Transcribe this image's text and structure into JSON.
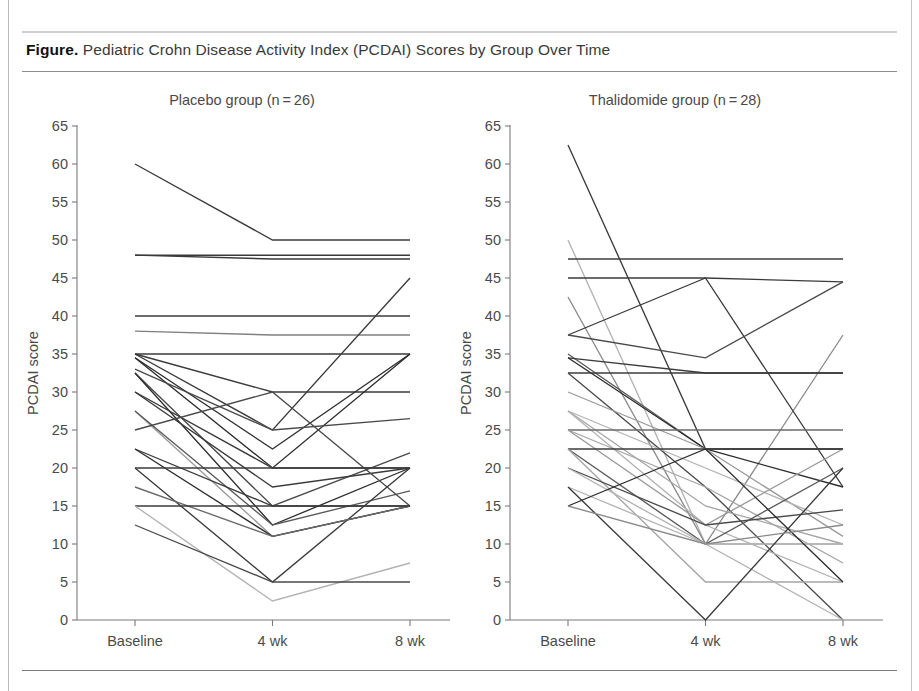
{
  "figure": {
    "label": "Figure.",
    "caption": "Pediatric Crohn Disease Activity Index (PCDAI) Scores by Group Over Time"
  },
  "chart_data": {
    "type": "line",
    "subtype": "parallel-coordinates-spaghetti",
    "title": "Pediatric Crohn Disease Activity Index (PCDAI) Scores by Group Over Time",
    "xlabel": "",
    "ylabel": "PCDAI score",
    "x": [
      "Baseline",
      "4 wk",
      "8 wk"
    ],
    "ylim": [
      0,
      65
    ],
    "yticks": [
      0,
      5,
      10,
      15,
      20,
      25,
      30,
      35,
      40,
      45,
      50,
      55,
      60,
      65
    ],
    "ytick_labels": [
      "0",
      "5",
      "10",
      "15",
      "20",
      "25",
      "30",
      "35",
      "40",
      "45",
      "50",
      "55",
      "60",
      "65"
    ],
    "grid": false,
    "legend": "none",
    "panels": [
      {
        "name": "placebo",
        "title": "Placebo group (n = 26)",
        "n": 26,
        "series": [
          {
            "name": "P1",
            "values": [
              60,
              50,
              50
            ],
            "shade": "#3b3b3b"
          },
          {
            "name": "P2",
            "values": [
              48,
              48,
              48
            ],
            "shade": "#3b3b3b"
          },
          {
            "name": "P3",
            "values": [
              48,
              47.5,
              47.5
            ],
            "shade": "#3b3b3b"
          },
          {
            "name": "P4",
            "values": [
              40,
              40,
              40
            ],
            "shade": "#3b3b3b"
          },
          {
            "name": "P5",
            "values": [
              38,
              37.5,
              37.5
            ],
            "shade": "#808080"
          },
          {
            "name": "P6",
            "values": [
              35,
              35,
              35
            ],
            "shade": "#3b3b3b"
          },
          {
            "name": "P7",
            "values": [
              35,
              30,
              30
            ],
            "shade": "#3b3b3b"
          },
          {
            "name": "P8",
            "values": [
              35,
              25,
              45
            ],
            "shade": "#3b3b3b"
          },
          {
            "name": "P9",
            "values": [
              34.5,
              22.5,
              35
            ],
            "shade": "#2d2d2d"
          },
          {
            "name": "P10",
            "values": [
              34.5,
              20,
              35
            ],
            "shade": "#2d2d2d"
          },
          {
            "name": "P11",
            "values": [
              33,
              25,
              26.5
            ],
            "shade": "#4a4a4a"
          },
          {
            "name": "P12",
            "values": [
              32.5,
              15,
              22
            ],
            "shade": "#4a4a4a"
          },
          {
            "name": "P13",
            "values": [
              32.5,
              12.5,
              20
            ],
            "shade": "#2d2d2d"
          },
          {
            "name": "P14",
            "values": [
              30,
              17.5,
              20
            ],
            "shade": "#3b3b3b"
          },
          {
            "name": "P15",
            "values": [
              30,
              20,
              20
            ],
            "shade": "#3b3b3b"
          },
          {
            "name": "P16",
            "values": [
              27.5,
              11,
              15
            ],
            "shade": "#9a9a9a"
          },
          {
            "name": "P17",
            "values": [
              27.5,
              12.5,
              17
            ],
            "shade": "#5a5a5a"
          },
          {
            "name": "P18",
            "values": [
              25,
              30,
              15
            ],
            "shade": "#4a4a4a"
          },
          {
            "name": "P19",
            "values": [
              22.5,
              11,
              15
            ],
            "shade": "#2d2d2d"
          },
          {
            "name": "P20",
            "values": [
              22.5,
              15,
              15
            ],
            "shade": "#3b3b3b"
          },
          {
            "name": "P21",
            "values": [
              20,
              20,
              20
            ],
            "shade": "#3b3b3b"
          },
          {
            "name": "P22",
            "values": [
              20,
              5,
              20
            ],
            "shade": "#3b3b3b"
          },
          {
            "name": "P23",
            "values": [
              17.5,
              11,
              15
            ],
            "shade": "#6a6a6a"
          },
          {
            "name": "P24",
            "values": [
              15,
              15,
              15
            ],
            "shade": "#3b3b3b"
          },
          {
            "name": "P25",
            "values": [
              15,
              2.5,
              7.5
            ],
            "shade": "#b3b3b3"
          },
          {
            "name": "P26",
            "values": [
              12.5,
              5,
              5
            ],
            "shade": "#4a4a4a"
          }
        ]
      },
      {
        "name": "thalidomide",
        "title": "Thalidomide group (n = 28)",
        "n": 28,
        "series": [
          {
            "name": "T1",
            "values": [
              62.5,
              22.5,
              22.5
            ],
            "shade": "#3b3b3b"
          },
          {
            "name": "T2",
            "values": [
              50,
              10,
              10
            ],
            "shade": "#b3b3b3"
          },
          {
            "name": "T3",
            "values": [
              47.5,
              47.5,
              47.5
            ],
            "shade": "#3b3b3b"
          },
          {
            "name": "T4",
            "values": [
              45,
              45,
              44.5
            ],
            "shade": "#3b3b3b"
          },
          {
            "name": "T5",
            "values": [
              42.5,
              10,
              37.5
            ],
            "shade": "#8a8a8a"
          },
          {
            "name": "T6",
            "values": [
              37.5,
              45,
              17.5
            ],
            "shade": "#3b3b3b"
          },
          {
            "name": "T7",
            "values": [
              37.5,
              34.5,
              44.5
            ],
            "shade": "#4a4a4a"
          },
          {
            "name": "T8",
            "values": [
              35,
              22.5,
              22.5
            ],
            "shade": "#5a5a5a"
          },
          {
            "name": "T9",
            "values": [
              34.5,
              32.5,
              32.5
            ],
            "shade": "#3b3b3b"
          },
          {
            "name": "T10",
            "values": [
              34.5,
              22.5,
              17.5
            ],
            "shade": "#2d2d2d"
          },
          {
            "name": "T11",
            "values": [
              32.5,
              32.5,
              32.5
            ],
            "shade": "#3b3b3b"
          },
          {
            "name": "T12",
            "values": [
              32.5,
              17.5,
              0
            ],
            "shade": "#4a4a4a"
          },
          {
            "name": "T13",
            "values": [
              30,
              22.5,
              11
            ],
            "shade": "#9a9a9a"
          },
          {
            "name": "T14",
            "values": [
              27.5,
              20,
              12.5
            ],
            "shade": "#b3b3b3"
          },
          {
            "name": "T15",
            "values": [
              27.5,
              15,
              10
            ],
            "shade": "#a5a5a5"
          },
          {
            "name": "T16",
            "values": [
              27.5,
              12.5,
              5
            ],
            "shade": "#b3b3b3"
          },
          {
            "name": "T17",
            "values": [
              25,
              25,
              25
            ],
            "shade": "#6a6a6a"
          },
          {
            "name": "T18",
            "values": [
              25,
              17.5,
              7.5
            ],
            "shade": "#a5a5a5"
          },
          {
            "name": "T19",
            "values": [
              25,
              12.5,
              22.5
            ],
            "shade": "#9a9a9a"
          },
          {
            "name": "T20",
            "values": [
              22.5,
              22.5,
              22.5
            ],
            "shade": "#3b3b3b"
          },
          {
            "name": "T21",
            "values": [
              22.5,
              10,
              20
            ],
            "shade": "#5a5a5a"
          },
          {
            "name": "T22",
            "values": [
              22.5,
              5,
              5
            ],
            "shade": "#a5a5a5"
          },
          {
            "name": "T23",
            "values": [
              20,
              12.5,
              14.5
            ],
            "shade": "#4a4a4a"
          },
          {
            "name": "T24",
            "values": [
              20,
              10,
              10
            ],
            "shade": "#b3b3b3"
          },
          {
            "name": "T25",
            "values": [
              17.5,
              10,
              0
            ],
            "shade": "#b3b3b3"
          },
          {
            "name": "T26",
            "values": [
              17.5,
              0,
              20
            ],
            "shade": "#3b3b3b"
          },
          {
            "name": "T27",
            "values": [
              15,
              22.5,
              5
            ],
            "shade": "#2d2d2d"
          },
          {
            "name": "T28",
            "values": [
              15,
              10,
              12.5
            ],
            "shade": "#8a8a8a"
          }
        ]
      }
    ]
  }
}
